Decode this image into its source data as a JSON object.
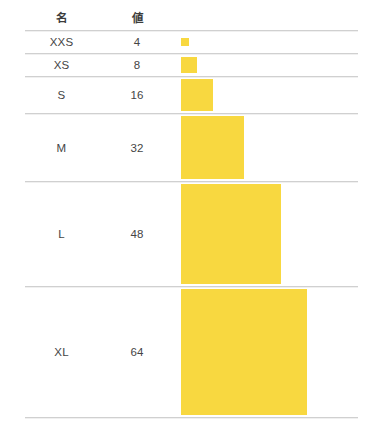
{
  "chart_data": {
    "type": "bar",
    "title": "",
    "subtitle": "",
    "xlabel": "",
    "ylabel": "",
    "legend": "none",
    "grid": false,
    "mark": "square",
    "encoding": "size",
    "categories": [
      "XXS",
      "XS",
      "S",
      "M",
      "L",
      "XL"
    ],
    "values": [
      4,
      8,
      16,
      32,
      48,
      64
    ],
    "series": [
      {
        "name": "値",
        "values": [
          4,
          8,
          16,
          32,
          48,
          64
        ]
      }
    ],
    "color": "#f8d840",
    "size_px": [
      8,
      16,
      32,
      63,
      100,
      126
    ]
  },
  "table": {
    "columns": [
      {
        "key": "name",
        "header": "名"
      },
      {
        "key": "value",
        "header": "値"
      },
      {
        "key": "mark",
        "header": ""
      }
    ],
    "rows": [
      {
        "name": "XXS",
        "value": "4",
        "size": 8
      },
      {
        "name": "XS",
        "value": "8",
        "size": 16
      },
      {
        "name": "S",
        "value": "16",
        "size": 32
      },
      {
        "name": "M",
        "value": "32",
        "size": 63
      },
      {
        "name": "L",
        "value": "48",
        "size": 100
      },
      {
        "name": "XL",
        "value": "64",
        "size": 126
      }
    ]
  },
  "style": {
    "mark_color": "#f8d840",
    "rule_color": "#d0d0d0",
    "text_color": "#454545",
    "background": "#ffffff"
  }
}
